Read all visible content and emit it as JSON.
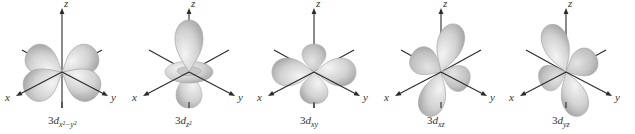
{
  "figure": {
    "colors": {
      "lobe_light": "#f2f2f2",
      "lobe_dark": "#a8a8a8",
      "axis": "#2a2a2a",
      "background": "#ffffff"
    },
    "axis_labels": {
      "x": "x",
      "y": "y",
      "z": "z"
    },
    "orbitals": [
      {
        "id": "dx2-y2",
        "caption_main": "3",
        "caption_d": "d",
        "caption_sub": "x²−y²",
        "shape": "four-lobe-xy-plane"
      },
      {
        "id": "dz2",
        "caption_main": "3",
        "caption_d": "d",
        "caption_sub": "z²",
        "shape": "z-lobes-with-torus"
      },
      {
        "id": "dxy",
        "caption_main": "3",
        "caption_d": "d",
        "caption_sub": "xy",
        "shape": "four-lobe-between-axes"
      },
      {
        "id": "dxz",
        "caption_main": "3",
        "caption_d": "d",
        "caption_sub": "xz",
        "shape": "four-lobe-xz-diagonal"
      },
      {
        "id": "dyz",
        "caption_main": "3",
        "caption_d": "d",
        "caption_sub": "yz",
        "shape": "four-lobe-yz-diagonal"
      }
    ]
  }
}
